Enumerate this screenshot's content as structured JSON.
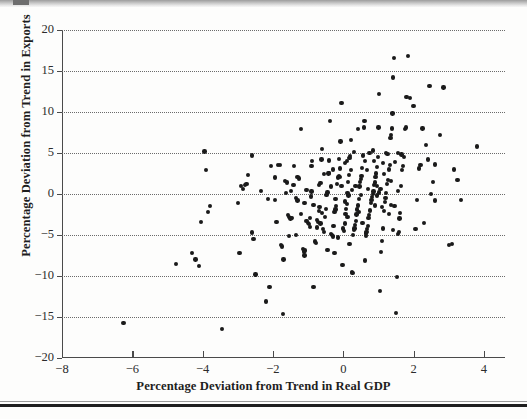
{
  "chart_data": {
    "type": "scatter",
    "title": "",
    "xlabel": "Percentage Deviation from Trend in Real GDP",
    "ylabel": "Percentage Deviation from Trend in Exports",
    "xlim": [
      -8,
      4.6
    ],
    "ylim": [
      -20,
      20
    ],
    "xticks": [
      -8,
      -6,
      -4,
      -2,
      0,
      2,
      4
    ],
    "xtick_labels": [
      "−8",
      "−6",
      "−4",
      "−2",
      "0",
      "2",
      "4"
    ],
    "yticks": [
      20,
      15,
      10,
      5,
      0,
      -5,
      -10,
      -15,
      -20
    ],
    "ytick_labels": [
      "20",
      "15",
      "10",
      "5",
      "0",
      "−5",
      "−10",
      "−15",
      "−20"
    ],
    "grid": "horizontal-dotted",
    "grid_values": [
      20,
      15,
      10,
      5,
      0,
      -5,
      -10,
      -15
    ],
    "legend": null,
    "marker": "filled-circle",
    "marker_color": "#1a1a1a",
    "n_points": 268,
    "points": [
      [
        -6.25,
        -15.7
      ],
      [
        -4.75,
        -8.5
      ],
      [
        -4.3,
        -7.2
      ],
      [
        -4.2,
        -8.0
      ],
      [
        -4.1,
        -8.8
      ],
      [
        -4.05,
        -3.4
      ],
      [
        -3.95,
        5.2
      ],
      [
        -3.9,
        2.9
      ],
      [
        -3.8,
        -1.5
      ],
      [
        -3.85,
        -2.2
      ],
      [
        -3.45,
        -16.5
      ],
      [
        -3.0,
        -1.1
      ],
      [
        -2.95,
        -7.2
      ],
      [
        -2.85,
        0.6
      ],
      [
        -2.8,
        1.1
      ],
      [
        -2.75,
        1.2
      ],
      [
        -2.7,
        2.3
      ],
      [
        -2.6,
        4.7
      ],
      [
        -2.6,
        -4.7
      ],
      [
        -2.55,
        -5.5
      ],
      [
        -2.5,
        -9.8
      ],
      [
        -2.2,
        -13.1
      ],
      [
        -2.15,
        -0.6
      ],
      [
        -2.1,
        -11.3
      ],
      [
        -1.95,
        -0.7
      ],
      [
        -1.85,
        3.5
      ],
      [
        -1.8,
        3.5
      ],
      [
        -1.78,
        -6.2
      ],
      [
        -1.75,
        -6.4
      ],
      [
        -1.72,
        -14.6
      ],
      [
        -1.7,
        -8.0
      ],
      [
        -1.65,
        1.6
      ],
      [
        -1.6,
        1.4
      ],
      [
        -1.58,
        -2.6
      ],
      [
        -1.55,
        -5.1
      ],
      [
        -1.5,
        -3.0
      ],
      [
        -1.45,
        -2.9
      ],
      [
        -1.42,
        1.1
      ],
      [
        -1.4,
        3.4
      ],
      [
        -1.35,
        -0.5
      ],
      [
        -1.3,
        -0.8
      ],
      [
        -1.25,
        1.9
      ],
      [
        -1.2,
        7.9
      ],
      [
        -1.15,
        -6.7
      ],
      [
        -1.12,
        -7.0
      ],
      [
        -1.1,
        -7.5
      ],
      [
        -1.08,
        -6.9
      ],
      [
        -1.05,
        -3.3
      ],
      [
        -1.0,
        -3.5
      ],
      [
        -0.98,
        -3.7
      ],
      [
        -0.95,
        -2.9
      ],
      [
        -0.92,
        -0.3
      ],
      [
        -0.9,
        3.4
      ],
      [
        -0.88,
        4.0
      ],
      [
        -0.85,
        -11.3
      ],
      [
        -0.8,
        -5.8
      ],
      [
        -0.78,
        -6.0
      ],
      [
        -0.75,
        -3.2
      ],
      [
        -0.72,
        -3.4
      ],
      [
        -0.7,
        -2.1
      ],
      [
        -0.68,
        -1.6
      ],
      [
        -0.65,
        1.3
      ],
      [
        -0.62,
        4.2
      ],
      [
        -0.6,
        5.5
      ],
      [
        -0.58,
        -4.3
      ],
      [
        -0.55,
        -4.6
      ],
      [
        -0.52,
        -2.8
      ],
      [
        -0.5,
        -1.8
      ],
      [
        -0.48,
        -0.1
      ],
      [
        -0.45,
        0.2
      ],
      [
        -0.42,
        2.5
      ],
      [
        -0.4,
        2.6
      ],
      [
        -0.38,
        8.9
      ],
      [
        -0.35,
        -4.9
      ],
      [
        -0.32,
        -5.0
      ],
      [
        -0.3,
        -5.2
      ],
      [
        -0.28,
        -3.9
      ],
      [
        -0.25,
        -2.2
      ],
      [
        -0.22,
        -1.9
      ],
      [
        -0.2,
        -1.5
      ],
      [
        -0.18,
        1.2
      ],
      [
        -0.15,
        2.0
      ],
      [
        -0.12,
        2.2
      ],
      [
        -0.1,
        2.1
      ],
      [
        -0.08,
        6.4
      ],
      [
        -0.05,
        11.1
      ],
      [
        -0.02,
        -8.7
      ],
      [
        0.0,
        -4.2
      ],
      [
        0.02,
        -4.5
      ],
      [
        0.04,
        -3.6
      ],
      [
        0.06,
        -2.4
      ],
      [
        0.08,
        -1.8
      ],
      [
        0.1,
        -1.2
      ],
      [
        0.12,
        0.1
      ],
      [
        0.14,
        1.5
      ],
      [
        0.16,
        2.3
      ],
      [
        0.18,
        4.4
      ],
      [
        0.2,
        4.6
      ],
      [
        0.22,
        6.6
      ],
      [
        0.24,
        -9.5
      ],
      [
        0.26,
        -9.6
      ],
      [
        0.28,
        -5.0
      ],
      [
        0.3,
        -4.4
      ],
      [
        0.32,
        -4.2
      ],
      [
        0.34,
        -3.8
      ],
      [
        0.36,
        -3.3
      ],
      [
        0.38,
        -2.5
      ],
      [
        0.4,
        -1.9
      ],
      [
        0.42,
        -1.4
      ],
      [
        0.44,
        -0.6
      ],
      [
        0.46,
        0.9
      ],
      [
        0.48,
        1.5
      ],
      [
        0.5,
        1.8
      ],
      [
        0.52,
        2.2
      ],
      [
        0.54,
        3.2
      ],
      [
        0.56,
        4.7
      ],
      [
        0.58,
        8.1
      ],
      [
        0.6,
        8.9
      ],
      [
        0.62,
        -8.1
      ],
      [
        0.64,
        -4.8
      ],
      [
        0.66,
        -4.6
      ],
      [
        0.68,
        -4.3
      ],
      [
        0.7,
        -3.9
      ],
      [
        0.72,
        -2.9
      ],
      [
        0.74,
        -2.6
      ],
      [
        0.76,
        -2.0
      ],
      [
        0.78,
        -1.1
      ],
      [
        0.8,
        -0.7
      ],
      [
        0.82,
        -0.4
      ],
      [
        0.84,
        0.0
      ],
      [
        0.86,
        0.3
      ],
      [
        0.88,
        1.1
      ],
      [
        0.9,
        1.4
      ],
      [
        0.92,
        2.1
      ],
      [
        0.94,
        2.5
      ],
      [
        0.96,
        3.3
      ],
      [
        0.98,
        4.5
      ],
      [
        1.0,
        8.1
      ],
      [
        1.02,
        12.2
      ],
      [
        1.05,
        -11.8
      ],
      [
        1.08,
        -7.1
      ],
      [
        1.1,
        -5.7
      ],
      [
        1.12,
        -4.2
      ],
      [
        1.15,
        -2.1
      ],
      [
        1.18,
        -1.0
      ],
      [
        1.2,
        -0.5
      ],
      [
        1.22,
        0.1
      ],
      [
        1.25,
        1.2
      ],
      [
        1.28,
        1.7
      ],
      [
        1.3,
        3.0
      ],
      [
        1.32,
        3.5
      ],
      [
        1.34,
        6.8
      ],
      [
        1.36,
        7.2
      ],
      [
        1.38,
        8.0
      ],
      [
        1.4,
        9.8
      ],
      [
        1.42,
        14.2
      ],
      [
        1.45,
        16.6
      ],
      [
        1.5,
        -14.5
      ],
      [
        1.52,
        -10.1
      ],
      [
        1.55,
        -4.9
      ],
      [
        1.58,
        -4.6
      ],
      [
        1.6,
        -3.0
      ],
      [
        1.62,
        -2.3
      ],
      [
        1.65,
        1.0
      ],
      [
        1.68,
        2.9
      ],
      [
        1.7,
        3.4
      ],
      [
        1.72,
        4.5
      ],
      [
        1.75,
        7.9
      ],
      [
        1.78,
        8.1
      ],
      [
        1.8,
        11.8
      ],
      [
        1.85,
        16.8
      ],
      [
        1.9,
        11.7
      ],
      [
        2.0,
        10.7
      ],
      [
        2.05,
        -4.3
      ],
      [
        2.1,
        -0.7
      ],
      [
        2.15,
        3.1
      ],
      [
        2.2,
        3.5
      ],
      [
        2.25,
        8.0
      ],
      [
        2.3,
        -3.5
      ],
      [
        2.35,
        6.0
      ],
      [
        2.4,
        4.2
      ],
      [
        2.45,
        13.2
      ],
      [
        2.5,
        0.0
      ],
      [
        2.55,
        1.5
      ],
      [
        2.6,
        -0.8
      ],
      [
        2.75,
        7.2
      ],
      [
        2.85,
        13.0
      ],
      [
        3.0,
        -6.2
      ],
      [
        3.1,
        -6.1
      ],
      [
        3.15,
        3.0
      ],
      [
        3.25,
        1.7
      ],
      [
        3.35,
        -0.7
      ],
      [
        3.8,
        5.8
      ],
      [
        -1.95,
        2.0
      ],
      [
        -1.3,
        2.1
      ],
      [
        -2.9,
        1.0
      ],
      [
        -2.35,
        0.4
      ],
      [
        0.05,
        -0.9
      ],
      [
        0.15,
        -0.2
      ],
      [
        0.25,
        0.5
      ],
      [
        0.35,
        1.0
      ],
      [
        0.45,
        -2.2
      ],
      [
        0.55,
        -3.5
      ],
      [
        0.65,
        -5.1
      ],
      [
        0.75,
        5.0
      ],
      [
        0.85,
        5.3
      ],
      [
        0.95,
        -0.2
      ],
      [
        1.06,
        0.6
      ],
      [
        1.16,
        2.4
      ],
      [
        1.26,
        4.9
      ],
      [
        1.36,
        1.6
      ],
      [
        1.46,
        -1.5
      ],
      [
        1.56,
        0.4
      ],
      [
        1.66,
        4.8
      ],
      [
        -0.6,
        -2.3
      ],
      [
        -0.7,
        1.1
      ],
      [
        -0.9,
        0.3
      ],
      [
        -1.1,
        -1.1
      ],
      [
        -1.2,
        -2.4
      ],
      [
        -0.3,
        3.0
      ],
      [
        -0.1,
        3.1
      ],
      [
        0.1,
        4.0
      ],
      [
        0.3,
        5.1
      ],
      [
        0.5,
        -0.1
      ],
      [
        0.7,
        0.6
      ],
      [
        0.9,
        -1.4
      ],
      [
        1.1,
        -1.6
      ],
      [
        1.3,
        -2.4
      ],
      [
        -0.45,
        -6.8
      ],
      [
        -0.25,
        -7.2
      ],
      [
        -0.15,
        -5.3
      ],
      [
        0.18,
        -6.1
      ],
      [
        -2.05,
        3.4
      ],
      [
        -1.62,
        0.1
      ],
      [
        -1.48,
        0.4
      ],
      [
        -0.05,
        1.0
      ],
      [
        0.12,
        -2.8
      ],
      [
        0.22,
        2.9
      ],
      [
        -0.35,
        0.9
      ],
      [
        -0.55,
        2.4
      ],
      [
        1.02,
        0.2
      ],
      [
        1.12,
        3.8
      ],
      [
        1.22,
        5.0
      ],
      [
        0.42,
        7.9
      ],
      [
        0.62,
        4.0
      ],
      [
        -0.12,
        4.3
      ],
      [
        -0.22,
        -0.6
      ],
      [
        0.05,
        3.8
      ],
      [
        0.68,
        2.9
      ],
      [
        0.88,
        4.0
      ],
      [
        1.48,
        3.9
      ],
      [
        1.55,
        5.0
      ],
      [
        0.95,
        1.0
      ],
      [
        -0.85,
        -1.3
      ],
      [
        -1.05,
        0.5
      ],
      [
        -1.9,
        -3.4
      ],
      [
        -1.55,
        -2.8
      ],
      [
        -1.35,
        -5.0
      ],
      [
        -0.95,
        -4.0
      ],
      [
        -0.75,
        -4.1
      ],
      [
        -0.65,
        -3.6
      ],
      [
        1.42,
        -4.4
      ],
      [
        1.35,
        -1.3
      ],
      [
        2.6,
        3.6
      ],
      [
        -0.4,
        4.1
      ]
    ]
  },
  "axes": {
    "x_title": "Percentage Deviation from Trend in Real GDP",
    "y_title": "Percentage Deviation from Trend in Exports"
  }
}
